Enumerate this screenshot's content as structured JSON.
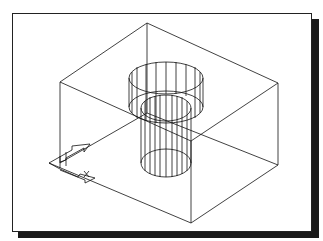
{
  "figure": {
    "type": "isometric-wireframe",
    "colors": {
      "line": "#111111",
      "background": "#ffffff",
      "shadow": "#1a1a1a"
    },
    "icons": [
      "ucs-axis-icon"
    ]
  }
}
